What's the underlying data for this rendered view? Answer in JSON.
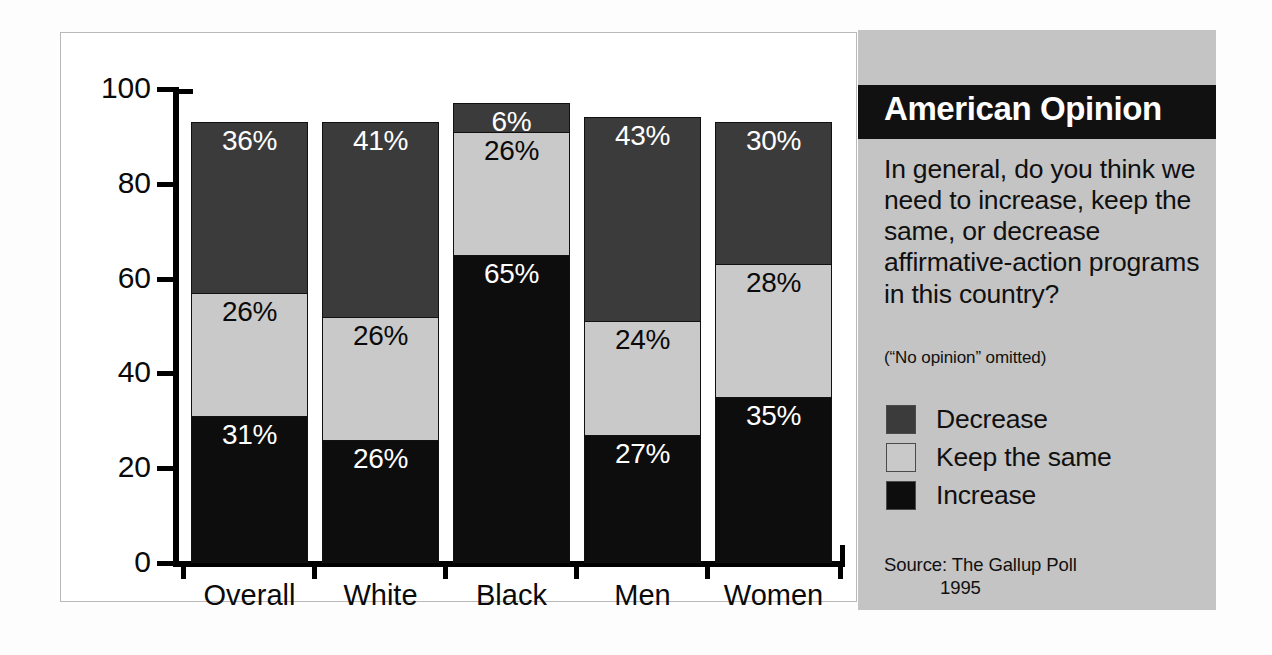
{
  "chart_data": {
    "type": "bar",
    "subtype": "stacked-bar-100",
    "title": "American Opinion",
    "xlabel": "",
    "ylabel": "",
    "ylim": [
      0,
      100
    ],
    "yticks": [
      0,
      20,
      40,
      60,
      80,
      100
    ],
    "ytick_labels": [
      "0",
      "20",
      "40",
      "60",
      "80",
      "100"
    ],
    "grid": false,
    "legend_position": "right-panel",
    "categories": [
      "Overall",
      "White",
      "Black",
      "Men",
      "Women"
    ],
    "series": [
      {
        "name": "Increase",
        "color": "#0d0d0d",
        "values": [
          31,
          26,
          65,
          27,
          35
        ],
        "labels": [
          "31%",
          "26%",
          "65%",
          "27%",
          "35%"
        ],
        "label_color": "#ffffff"
      },
      {
        "name": "Keep the same",
        "color": "#c9c9c9",
        "values": [
          26,
          26,
          26,
          24,
          28
        ],
        "labels": [
          "26%",
          "26%",
          "26%",
          "24%",
          "28%"
        ],
        "label_color": "#0a0a0a"
      },
      {
        "name": "Decrease",
        "color": "#3b3b3b",
        "values": [
          36,
          41,
          6,
          43,
          30
        ],
        "labels": [
          "36%",
          "41%",
          "6%",
          "43%",
          "30%"
        ],
        "label_color": "#ffffff"
      }
    ],
    "annotations": [
      "(“No opinion” omitted)"
    ],
    "source": "Source:  The Gallup Poll",
    "source_year": "1995"
  },
  "panel": {
    "title": "American Opinion",
    "question": "In general, do you think we need to increase, keep the same, or decrease affirmative-action programs in this country?",
    "note": "(“No opinion” omitted)",
    "legend": [
      {
        "label": "Decrease",
        "color": "#3b3b3b"
      },
      {
        "label": "Keep the same",
        "color": "#c9c9c9"
      },
      {
        "label": "Increase",
        "color": "#0d0d0d"
      }
    ],
    "source_label": "Source:  The Gallup Poll",
    "source_year": "1995"
  },
  "axis": {
    "y_labels": [
      "100",
      "80",
      "60",
      "40",
      "20",
      "0"
    ],
    "x_labels": [
      "Overall",
      "White",
      "Black",
      "Men",
      "Women"
    ]
  },
  "colors": {
    "panel_background": "#c4c4c4",
    "title_bar": "#111111",
    "chart_background": "#ffffff",
    "axis": "#000000",
    "decrease": "#3b3b3b",
    "keep_the_same": "#c9c9c9",
    "increase": "#0d0d0d"
  }
}
